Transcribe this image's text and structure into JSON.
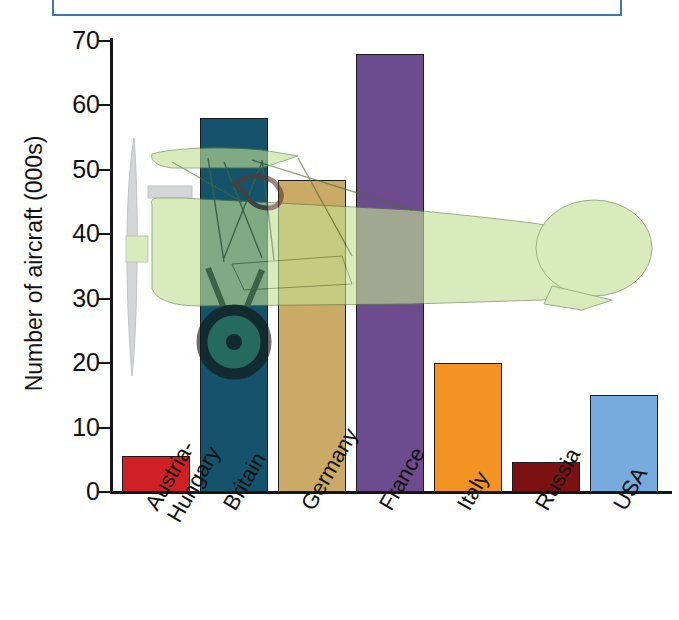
{
  "caption": {
    "text": "Aircraft production of the major powers, 1914-1918",
    "border_color": "#3a78ad",
    "visible_fragment": true
  },
  "chart_data": {
    "type": "bar",
    "title": "",
    "xlabel": "",
    "ylabel": "Number of aircraft (000s)",
    "categories": [
      "Austria-\nHungary",
      "Britain",
      "Germany",
      "France",
      "Italy",
      "Russia",
      "USA"
    ],
    "values": [
      5.6,
      58,
      48.4,
      68,
      20,
      4.6,
      15
    ],
    "colors": [
      "#cf2026",
      "#14536b",
      "#cbaa67",
      "#6c4b8e",
      "#f39323",
      "#7b1113",
      "#77aadd"
    ],
    "ylim": [
      0,
      70
    ],
    "yticks": [
      0,
      10,
      20,
      30,
      40,
      50,
      60,
      70
    ],
    "ytick_labels": [
      "0",
      "10",
      "20",
      "30",
      "40",
      "50",
      "60",
      "70"
    ],
    "grid": false,
    "legend": "none",
    "bar_edge_color": "#1c1c1c",
    "overlay": "biplane illustration",
    "overlay_color": "#c3e094"
  },
  "axes": {
    "line_color": "#151515"
  }
}
